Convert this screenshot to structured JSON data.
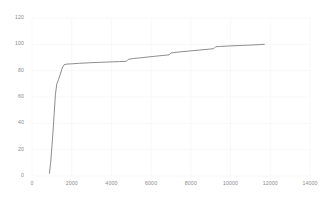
{
  "chart_data": {
    "type": "line",
    "title": "",
    "subtitle": "",
    "xlabel": "",
    "ylabel": "",
    "xlim": [
      0,
      14000
    ],
    "ylim": [
      0,
      120
    ],
    "grid": true,
    "grid_color": "#f0f0f0",
    "legend": null,
    "legend_position": "none",
    "line_color": "#707070",
    "line_width": 0.8,
    "background_color": "#ffffff",
    "tick_label_color": "#8a8a8a",
    "x_ticks": [
      0,
      2000,
      4000,
      6000,
      8000,
      10000,
      12000,
      14000
    ],
    "x_tick_labels": [
      "0",
      "2000",
      "4000",
      "6000",
      "8000",
      "10000",
      "12000",
      "14000"
    ],
    "y_ticks": [
      0,
      20,
      40,
      60,
      80,
      100,
      120
    ],
    "y_tick_labels": [
      "0",
      "20",
      "40",
      "60",
      "80",
      "100",
      "120"
    ],
    "series": [
      {
        "name": "cumulative",
        "x": [
          880,
          950,
          1000,
          1060,
          1120,
          1180,
          1250,
          1330,
          1420,
          1520,
          1620,
          1750,
          2000,
          2400,
          2900,
          3400,
          3900,
          4400,
          4750,
          4850,
          5100,
          5600,
          6100,
          6550,
          6900,
          7000,
          7120,
          7400,
          7900,
          8400,
          8900,
          9150,
          9250,
          9500,
          10000,
          10600,
          11100,
          11450,
          11700
        ],
        "y": [
          2,
          12,
          22,
          34,
          48,
          62,
          70,
          73,
          77,
          82,
          84.5,
          85,
          85.2,
          85.6,
          86,
          86.3,
          86.6,
          86.9,
          87.1,
          88.6,
          89.2,
          90,
          90.8,
          91.5,
          92,
          93.4,
          93.7,
          94.2,
          94.9,
          95.6,
          96.3,
          96.7,
          98.2,
          98.4,
          98.8,
          99.2,
          99.5,
          99.8,
          100
        ]
      }
    ]
  }
}
